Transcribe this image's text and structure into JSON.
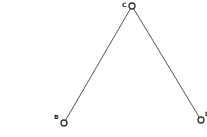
{
  "diagram": {
    "nodes": [
      {
        "id": "C",
        "label": "C"
      },
      {
        "id": "B",
        "label": "B"
      },
      {
        "id": "D",
        "label": "D"
      }
    ],
    "edges": [
      {
        "from": "C",
        "to": "B"
      },
      {
        "from": "C",
        "to": "D"
      }
    ]
  }
}
